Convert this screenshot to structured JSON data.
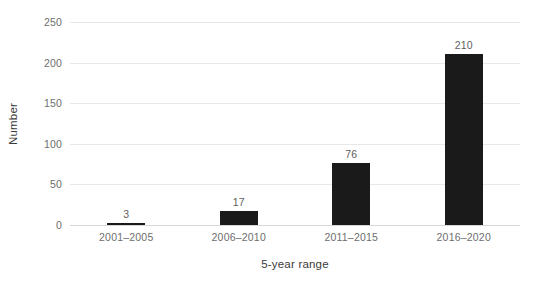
{
  "chart_data": {
    "type": "bar",
    "title": "",
    "subtitle": "",
    "xlabel": "5-year range",
    "ylabel": "Number",
    "categories": [
      "2001–2005",
      "2006–2010",
      "2011–2015",
      "2016–2020"
    ],
    "values": [
      3,
      17,
      76,
      210
    ],
    "value_labels": [
      "3",
      "17",
      "76",
      "210"
    ],
    "series": [
      {
        "name": "Number",
        "values": [
          3,
          17,
          76,
          210
        ]
      }
    ],
    "ylim": [
      0,
      250
    ],
    "yticks": [
      0,
      50,
      100,
      150,
      200,
      250
    ],
    "ytick_labels": [
      "0",
      "50",
      "100",
      "150",
      "200",
      "250"
    ],
    "grid": "horizontal",
    "legend": "none",
    "bar_color": "#1a1a1a",
    "gridline_color": "#e8e8e8",
    "axis_text_color": "#6e6e6e",
    "axis_title_color": "#3b3b3b",
    "background_color": "#ffffff"
  }
}
